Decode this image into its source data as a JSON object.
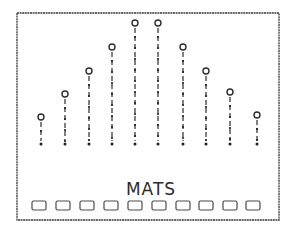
{
  "diagram": {
    "label": "MATS",
    "frame": {
      "x": 17,
      "y": 13,
      "width": 262,
      "height": 207
    },
    "colors": {
      "ink": "#2b2b2b",
      "background": "#ffffff"
    },
    "stem_base_y": 144,
    "stems": [
      {
        "index": 1,
        "x": 41,
        "top_y": 117
      },
      {
        "index": 2,
        "x": 65,
        "top_y": 94
      },
      {
        "index": 3,
        "x": 89,
        "top_y": 71
      },
      {
        "index": 4,
        "x": 112,
        "top_y": 47
      },
      {
        "index": 5,
        "x": 135,
        "top_y": 23
      },
      {
        "index": 6,
        "x": 158,
        "top_y": 23
      },
      {
        "index": 7,
        "x": 183,
        "top_y": 47
      },
      {
        "index": 8,
        "x": 206,
        "top_y": 71
      },
      {
        "index": 9,
        "x": 230,
        "top_y": 92
      },
      {
        "index": 10,
        "x": 257,
        "top_y": 115
      }
    ],
    "mats": [
      {
        "index": 1,
        "x": 32
      },
      {
        "index": 2,
        "x": 56
      },
      {
        "index": 3,
        "x": 80
      },
      {
        "index": 4,
        "x": 104
      },
      {
        "index": 5,
        "x": 128
      },
      {
        "index": 6,
        "x": 152
      },
      {
        "index": 7,
        "x": 176
      },
      {
        "index": 8,
        "x": 199
      },
      {
        "index": 9,
        "x": 223
      },
      {
        "index": 10,
        "x": 246
      }
    ],
    "mat_size": {
      "width": 14,
      "height": 9,
      "y": 201
    }
  }
}
